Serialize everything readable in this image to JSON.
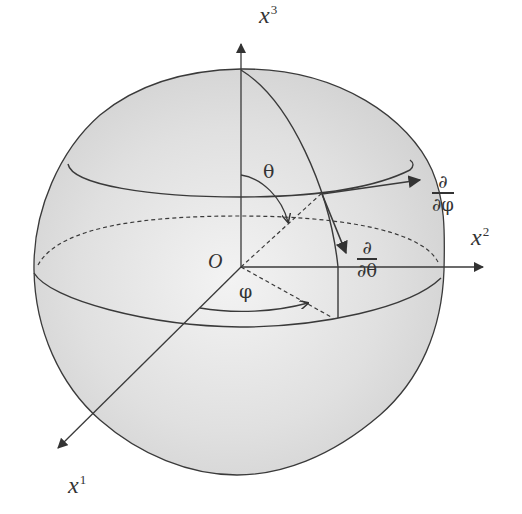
{
  "diagram": {
    "colors": {
      "sphere_fill": "#dcdcdc",
      "sphere_highlight": "#f2f2f2",
      "line": "#3a3a3a",
      "background": "#ffffff"
    },
    "axes": {
      "x1": {
        "base": "x",
        "sup": "1"
      },
      "x2": {
        "base": "x",
        "sup": "2"
      },
      "x3": {
        "base": "x",
        "sup": "3"
      }
    },
    "origin_label": "O",
    "angles": {
      "theta": "θ",
      "phi": "φ"
    },
    "basis_vectors": {
      "d_dphi": {
        "numerator": "∂",
        "denominator": "∂φ"
      },
      "d_dtheta": {
        "numerator": "∂",
        "denominator": "∂θ"
      }
    },
    "elements": [
      "sphere",
      "equator (dashed back half)",
      "latitude circle (upper)",
      "meridian through point",
      "dashed radius to point",
      "dashed projection in equatorial plane"
    ]
  }
}
